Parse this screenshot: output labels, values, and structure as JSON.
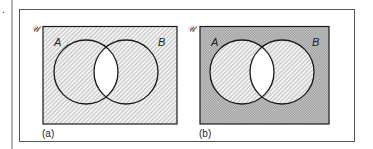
{
  "figure": {
    "panels": [
      {
        "caption": "(a)",
        "universe_label": "𝒰",
        "set_a_label": "A",
        "set_b_label": "B",
        "shading": "everything except A∩B shaded with diagonal hatch"
      },
      {
        "caption": "(b)",
        "universe_label": "𝒰",
        "set_a_label": "A",
        "set_b_label": "B",
        "shading": "outside A∪B crosshatched; A and B (excluding intersection) diagonal hatch; A∩B unshaded"
      }
    ],
    "colors": {
      "line": "#1a1a1a",
      "hatch": "#9a9a9a",
      "cross": "#8c8c8c",
      "frame": "#555555"
    }
  }
}
